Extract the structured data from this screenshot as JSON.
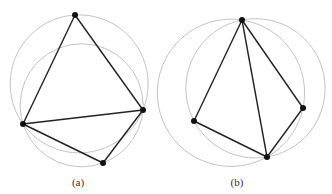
{
  "figure": {
    "width": 332,
    "height": 194,
    "colors": {
      "edge": "#222222",
      "circle": "#c4c4c4",
      "vertex": "#111111",
      "caption": "#333333",
      "background": "#ffffff"
    },
    "panels": [
      {
        "id": "a",
        "caption": "(a)",
        "caption_pos": [
          78,
          184
        ],
        "points": {
          "top": [
            75,
            15
          ],
          "left": [
            23,
            124
          ],
          "right": [
            143,
            110
          ],
          "bottom": [
            103,
            163
          ]
        },
        "edges": [
          [
            "top",
            "left"
          ],
          [
            "top",
            "right"
          ],
          [
            "left",
            "right"
          ],
          [
            "left",
            "bottom"
          ],
          [
            "right",
            "bottom"
          ]
        ],
        "circumcircles": [
          [
            "top",
            "left",
            "right"
          ],
          [
            "left",
            "right",
            "bottom"
          ]
        ]
      },
      {
        "id": "b",
        "caption": "(b)",
        "caption_pos": [
          237,
          184
        ],
        "points": {
          "top": [
            242,
            20
          ],
          "left": [
            194,
            121
          ],
          "right": [
            303,
            108
          ],
          "bottom": [
            267,
            157
          ]
        },
        "edges": [
          [
            "top",
            "left"
          ],
          [
            "top",
            "right"
          ],
          [
            "top",
            "bottom"
          ],
          [
            "left",
            "bottom"
          ],
          [
            "right",
            "bottom"
          ]
        ],
        "circumcircles": [
          [
            "top",
            "left",
            "bottom"
          ],
          [
            "top",
            "right",
            "bottom"
          ]
        ]
      }
    ]
  }
}
